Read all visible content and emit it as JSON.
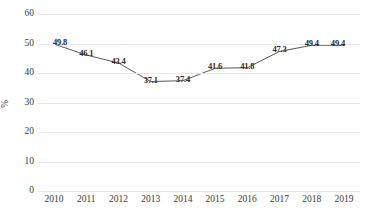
{
  "chart_data": {
    "type": "line",
    "title": "",
    "xlabel": "",
    "ylabel": "%",
    "categories": [
      "2010",
      "2011",
      "2012",
      "2013",
      "2014",
      "2015",
      "2016",
      "2017",
      "2018",
      "2019"
    ],
    "values": [
      49.8,
      46.1,
      43.4,
      37.1,
      37.4,
      41.6,
      41.8,
      47.3,
      49.4,
      49.4
    ],
    "data_labels": [
      "49.8",
      "46.1",
      "43.4",
      "37.1",
      "37.4",
      "41.6",
      "41.8",
      "47.3",
      "49.4",
      "49.4"
    ],
    "ylim": [
      0,
      60
    ],
    "y_ticks": [
      60,
      50,
      40,
      30,
      20,
      10,
      0
    ],
    "y_tick_labels": [
      "60",
      "50",
      "40",
      "30",
      "20",
      "10",
      "0"
    ],
    "grid": true,
    "grid_axis": "y",
    "legend": false,
    "legend_position": "none",
    "series": [
      {
        "name": "",
        "values": [
          49.8,
          46.1,
          43.4,
          37.1,
          37.4,
          41.6,
          41.8,
          47.3,
          49.4,
          49.4
        ]
      }
    ],
    "colors": {
      "line": "#595959",
      "grid": "#e8e8e8",
      "text": "#3a3a3a",
      "label": "#2b2b2b",
      "background": "#ffffff"
    }
  }
}
